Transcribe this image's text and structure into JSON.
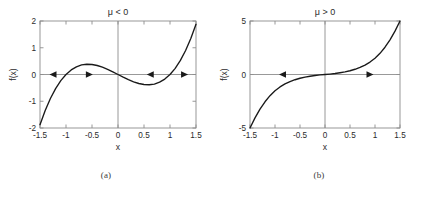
{
  "figure": {
    "background": "#ffffff",
    "line_color": "#1a1a1a",
    "axis_color": "#8d8d8d",
    "text_color": "#2b2b2b"
  },
  "panels": [
    {
      "id": "a",
      "caption": "(a)",
      "title": "μ < 0",
      "xlabel": "x",
      "ylabel": "f(x)",
      "xticks": [
        "-1.5",
        "-1",
        "-0.5",
        "0",
        "0.5",
        "1",
        "1.5"
      ],
      "xtick_values": [
        -1.5,
        -1,
        -0.5,
        0,
        0.5,
        1,
        1.5
      ],
      "yticks": [
        "2",
        "1",
        "0",
        "-1",
        "-2"
      ],
      "ytick_values": [
        2,
        1,
        0,
        -1,
        -2
      ],
      "xlim": [
        -1.5,
        1.5
      ],
      "ylim": [
        -2,
        2
      ],
      "arrows": [
        {
          "x": -1.25,
          "direction": "left"
        },
        {
          "x": -0.55,
          "direction": "right"
        },
        {
          "x": 0.62,
          "direction": "left"
        },
        {
          "x": 1.28,
          "direction": "right"
        }
      ]
    },
    {
      "id": "b",
      "caption": "(b)",
      "title": "μ > 0",
      "xlabel": "x",
      "ylabel": "f(x)",
      "xticks": [
        "-1.5",
        "-1",
        "-0.5",
        "0",
        "0.5",
        "1",
        "1.5"
      ],
      "xtick_values": [
        -1.5,
        -1,
        -0.5,
        0,
        0.5,
        1,
        1.5
      ],
      "yticks": [
        "5",
        "0",
        "-5"
      ],
      "ytick_values": [
        5,
        0,
        -5
      ],
      "xlim": [
        -1.5,
        1.5
      ],
      "ylim": [
        -5,
        5
      ],
      "arrows": [
        {
          "x": -0.85,
          "direction": "left"
        },
        {
          "x": 0.9,
          "direction": "right"
        }
      ]
    }
  ],
  "chart_data": [
    {
      "type": "line",
      "panel": "a",
      "title": "μ < 0",
      "xlabel": "x",
      "ylabel": "f(x)",
      "xlim": [
        -1.5,
        1.5
      ],
      "ylim": [
        -2,
        2
      ],
      "xticks": [
        -1.5,
        -1,
        -0.5,
        0,
        0.5,
        1,
        1.5
      ],
      "yticks": [
        -2,
        -1,
        0,
        1,
        2
      ],
      "grid": false,
      "legend": "none",
      "function": "f(x) = x^3 - x",
      "annotations": [
        "arrow left at x=-1.25 on y=0",
        "arrow right at x=-0.55 on y=0",
        "arrow left at x=0.62 on y=0",
        "arrow right at x=1.28 on y=0"
      ],
      "x": [
        -1.5,
        -1.4,
        -1.3,
        -1.2,
        -1.1,
        -1.0,
        -0.9,
        -0.8,
        -0.7,
        -0.6,
        -0.5,
        -0.4,
        -0.3,
        -0.2,
        -0.1,
        0.0,
        0.1,
        0.2,
        0.3,
        0.4,
        0.5,
        0.6,
        0.7,
        0.8,
        0.9,
        1.0,
        1.1,
        1.2,
        1.3,
        1.4,
        1.5
      ],
      "y": [
        -1.875,
        -1.344,
        -0.897,
        -0.528,
        -0.231,
        0.0,
        0.171,
        0.288,
        0.357,
        0.384,
        0.375,
        0.336,
        0.273,
        0.192,
        0.099,
        0.0,
        -0.099,
        -0.192,
        -0.273,
        -0.336,
        -0.375,
        -0.384,
        -0.357,
        -0.288,
        -0.171,
        0.0,
        0.231,
        0.528,
        0.897,
        1.344,
        1.875
      ]
    },
    {
      "type": "line",
      "panel": "b",
      "title": "μ > 0",
      "xlabel": "x",
      "ylabel": "f(x)",
      "xlim": [
        -1.5,
        1.5
      ],
      "ylim": [
        -5,
        5
      ],
      "xticks": [
        -1.5,
        -1,
        -0.5,
        0,
        0.5,
        1,
        1.5
      ],
      "yticks": [
        -5,
        0,
        5
      ],
      "grid": false,
      "legend": "none",
      "function": "f(x) = x^3 + x (monotonic increasing)",
      "annotations": [
        "arrow left at x=-0.85 on y=0",
        "arrow right at x=0.9 on y=0"
      ],
      "x": [
        -1.5,
        -1.4,
        -1.3,
        -1.2,
        -1.1,
        -1.0,
        -0.9,
        -0.8,
        -0.7,
        -0.6,
        -0.5,
        -0.4,
        -0.3,
        -0.2,
        -0.1,
        0.0,
        0.1,
        0.2,
        0.3,
        0.4,
        0.5,
        0.6,
        0.7,
        0.8,
        0.9,
        1.0,
        1.1,
        1.2,
        1.3,
        1.4,
        1.5
      ],
      "y": [
        -5.0,
        -4.05,
        -3.24,
        -2.55,
        -1.98,
        -1.52,
        -1.16,
        -0.88,
        -0.66,
        -0.49,
        -0.35,
        -0.24,
        -0.16,
        -0.09,
        -0.04,
        0.0,
        0.04,
        0.09,
        0.16,
        0.24,
        0.35,
        0.49,
        0.66,
        0.88,
        1.16,
        1.52,
        1.98,
        2.55,
        3.24,
        4.05,
        5.0
      ]
    }
  ]
}
